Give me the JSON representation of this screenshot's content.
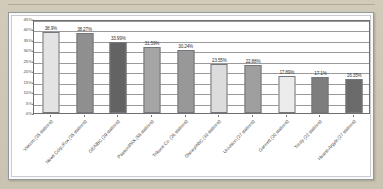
{
  "chart_data": {
    "type": "bar",
    "title": "",
    "xlabel": "",
    "ylabel": "",
    "ylim": [
      0,
      45
    ],
    "grid": true,
    "legend": "none",
    "orientation": "vertical",
    "categories": [
      "Viacom (35 stations)",
      "News Corp./Fox (35 stations)",
      "GE/NBC (29 stations)",
      "Paxson/PAX (58 stations)",
      "Tribune Co. (26 stations)",
      "Disney/ABC (10 stations)",
      "Univision (27 stations)",
      "Gannett (20 stations)",
      "Trinity (22 stations)",
      "Hearst-Argyle (27 stations)"
    ],
    "values": [
      38.9,
      38.27,
      33.99,
      31.59,
      30.24,
      23.55,
      22.88,
      17.89,
      17.1,
      16.35
    ],
    "data_labels": [
      "38.9%",
      "38.27%",
      "33.99%",
      "31.59%",
      "30.24%",
      "23.55%",
      "22.88%",
      "17.89%",
      "17.1%",
      "16.35%"
    ],
    "bar_colors": [
      "#e3e3e3",
      "#8f8f8f",
      "#636363",
      "#a5a5a5",
      "#989898",
      "#dcdcdc",
      "#9f9f9f",
      "#ececec",
      "#7e7e7e",
      "#6b6b6b"
    ],
    "y_ticks": [
      "45%",
      "40%",
      "35%",
      "30%",
      "25%",
      "20%",
      "15%",
      "10%",
      "5%",
      "0%"
    ],
    "y_tick_values": [
      45,
      40,
      35,
      30,
      25,
      20,
      15,
      10,
      5,
      0
    ]
  },
  "colors": {
    "page_background": "#cdc6b4",
    "card_background": "#ffffff",
    "card_border": "#8e99a6",
    "axis": "#6f6f6f",
    "gridline": "#9a9a9a",
    "text": "#4a4a4a"
  }
}
